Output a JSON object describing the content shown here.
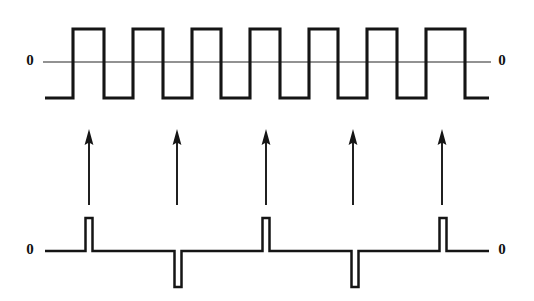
{
  "figure": {
    "caption": "",
    "background_color": "#ffffff",
    "ink_color": "#151515",
    "width": 534,
    "height": 301
  },
  "labels": {
    "top_left_zero": "0",
    "top_right_zero": "0",
    "bottom_left_zero": "0",
    "bottom_right_zero": "0"
  },
  "chart_data": {
    "type": "line",
    "title": "",
    "subtitle": "",
    "xlabel": "",
    "ylabel": "",
    "grid": false,
    "legend": "none",
    "xlim": [
      0,
      534
    ],
    "series": [
      {
        "name": "square-wave",
        "kind": "square-wave",
        "description": "Bipolar square wave with seven positive half-cycles crossing the zero axis",
        "level_high": 1,
        "level_low": -1,
        "y_axis_zero_px": 62,
        "y_high_px": 29,
        "y_low_px": 98,
        "x_start_px": 45,
        "x_end_px": 489,
        "start_level": -1,
        "end_level": -1,
        "transitions_px": [
          73,
          104,
          133,
          163,
          192,
          221,
          250,
          280,
          309,
          338,
          367,
          397,
          426,
          465
        ],
        "transition_count": 14,
        "high_pulse_count": 7,
        "values": [
          -1,
          1,
          -1,
          1,
          -1,
          1,
          -1,
          1,
          -1,
          1,
          -1,
          1,
          -1,
          1,
          -1
        ]
      },
      {
        "name": "spike-pulse-train",
        "kind": "impulse-train",
        "description": "Baseline with five narrow rectangular spikes, alternating positive and negative polarity",
        "y_baseline_px": 251,
        "y_peak_px": 218,
        "y_trough_px": 287,
        "x_start_px": 45,
        "x_end_px": 489,
        "pulse_width_px": 7,
        "pulses": [
          {
            "index": 1,
            "x_px": 89,
            "polarity": "positive",
            "value": 1
          },
          {
            "index": 2,
            "x_px": 178,
            "polarity": "negative",
            "value": -1
          },
          {
            "index": 3,
            "x_px": 266,
            "polarity": "positive",
            "value": 1
          },
          {
            "index": 4,
            "x_px": 355,
            "polarity": "negative",
            "value": -1
          },
          {
            "index": 5,
            "x_px": 443,
            "polarity": "positive",
            "value": 1
          }
        ]
      }
    ],
    "annotations": {
      "arrows": {
        "name": "up-arrows",
        "direction": "up",
        "count": 5,
        "y_tip_px": 130,
        "y_tail_px": 205,
        "x_positions_px": [
          89,
          177,
          266,
          353,
          442
        ]
      }
    }
  }
}
